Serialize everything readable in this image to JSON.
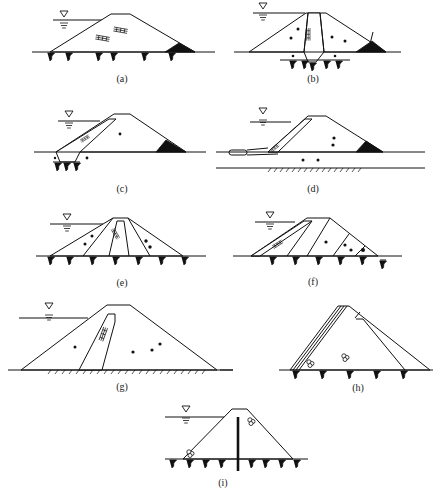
{
  "figure": {
    "panels": [
      {
        "id": "a",
        "label": "(a)",
        "type": "homogeneous dam with toe drain"
      },
      {
        "id": "b",
        "label": "(b)",
        "type": "central core dam with cutoff trench and toe drain"
      },
      {
        "id": "c",
        "label": "(c)",
        "type": "sloping core dam with cutoff and toe drain"
      },
      {
        "id": "d",
        "label": "(d)",
        "type": "sloping core with upstream blanket and toe drain"
      },
      {
        "id": "e",
        "label": "(e)",
        "type": "zoned dam with inclined central core"
      },
      {
        "id": "f",
        "label": "(f)",
        "type": "zoned dam with upstream sloping core"
      },
      {
        "id": "g",
        "label": "(g)",
        "type": "dam with inclined core on rock foundation"
      },
      {
        "id": "h",
        "label": "(h)",
        "type": "rockfill dam with upstream facing and downstream filter"
      },
      {
        "id": "i",
        "label": "(i)",
        "type": "dam with central cutoff wall"
      }
    ]
  },
  "symbols": {
    "water_level": "▽",
    "foundation_anchor": "root-shaped foundation symbol",
    "rock_hatch": "diagonal hatch ground line"
  }
}
